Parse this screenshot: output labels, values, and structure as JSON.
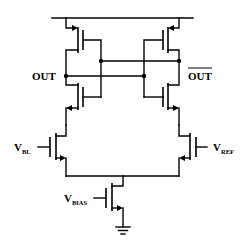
{
  "diagram": {
    "type": "circuit-schematic",
    "labels": {
      "out": "OUT",
      "out_bar": "OUT",
      "vbl_main": "V",
      "vbl_sub": "BL",
      "vref_main": "V",
      "vref_sub": "REF",
      "vbias_main": "V",
      "vbias_sub": "BIAS"
    },
    "components": [
      {
        "id": "MP1",
        "type": "pmos",
        "position": "top-left"
      },
      {
        "id": "MP2",
        "type": "pmos",
        "position": "top-right"
      },
      {
        "id": "MN1",
        "type": "nmos",
        "position": "middle-left"
      },
      {
        "id": "MN2",
        "type": "nmos",
        "position": "middle-right"
      },
      {
        "id": "MIN1",
        "type": "nmos",
        "position": "input-left",
        "gate": "V_BL"
      },
      {
        "id": "MIN2",
        "type": "nmos",
        "position": "input-right",
        "gate": "V_REF"
      },
      {
        "id": "MTAIL",
        "type": "nmos",
        "position": "tail",
        "gate": "V_BIAS"
      },
      {
        "id": "GND",
        "type": "ground"
      },
      {
        "id": "VDD",
        "type": "supply-rail"
      }
    ],
    "nodes": [
      "OUT",
      "OUT_BAR",
      "tail",
      "VDD",
      "GND"
    ]
  }
}
